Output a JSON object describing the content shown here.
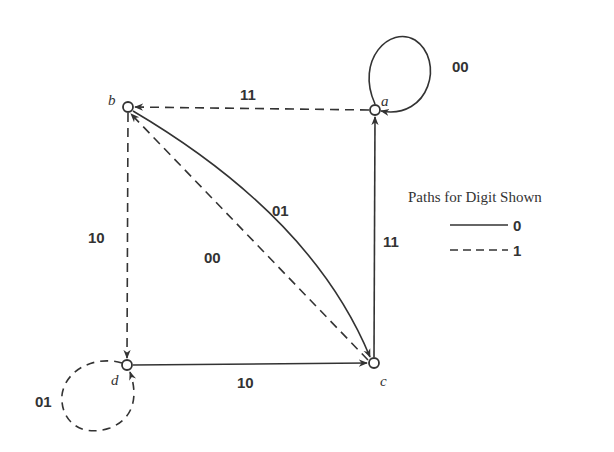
{
  "diagram": {
    "type": "state-transition-graph",
    "nodes": [
      {
        "id": "a",
        "label": "a"
      },
      {
        "id": "b",
        "label": "b"
      },
      {
        "id": "c",
        "label": "c"
      },
      {
        "id": "d",
        "label": "d"
      }
    ],
    "edges": [
      {
        "from": "a",
        "to": "a",
        "label": "00",
        "style": "solid"
      },
      {
        "from": "a",
        "to": "b",
        "label": "11",
        "style": "dashed"
      },
      {
        "from": "b",
        "to": "c",
        "label": "01",
        "style": "solid"
      },
      {
        "from": "c",
        "to": "b",
        "label": "00",
        "style": "dashed"
      },
      {
        "from": "b",
        "to": "d",
        "label": "10",
        "style": "dashed"
      },
      {
        "from": "c",
        "to": "a",
        "label": "11",
        "style": "solid"
      },
      {
        "from": "d",
        "to": "c",
        "label": "10",
        "style": "solid"
      },
      {
        "from": "d",
        "to": "d",
        "label": "01",
        "style": "dashed"
      }
    ],
    "legend": {
      "title": "Paths for Digit Shown",
      "items": [
        {
          "style": "solid",
          "label": "0"
        },
        {
          "style": "dashed",
          "label": "1"
        }
      ]
    }
  }
}
